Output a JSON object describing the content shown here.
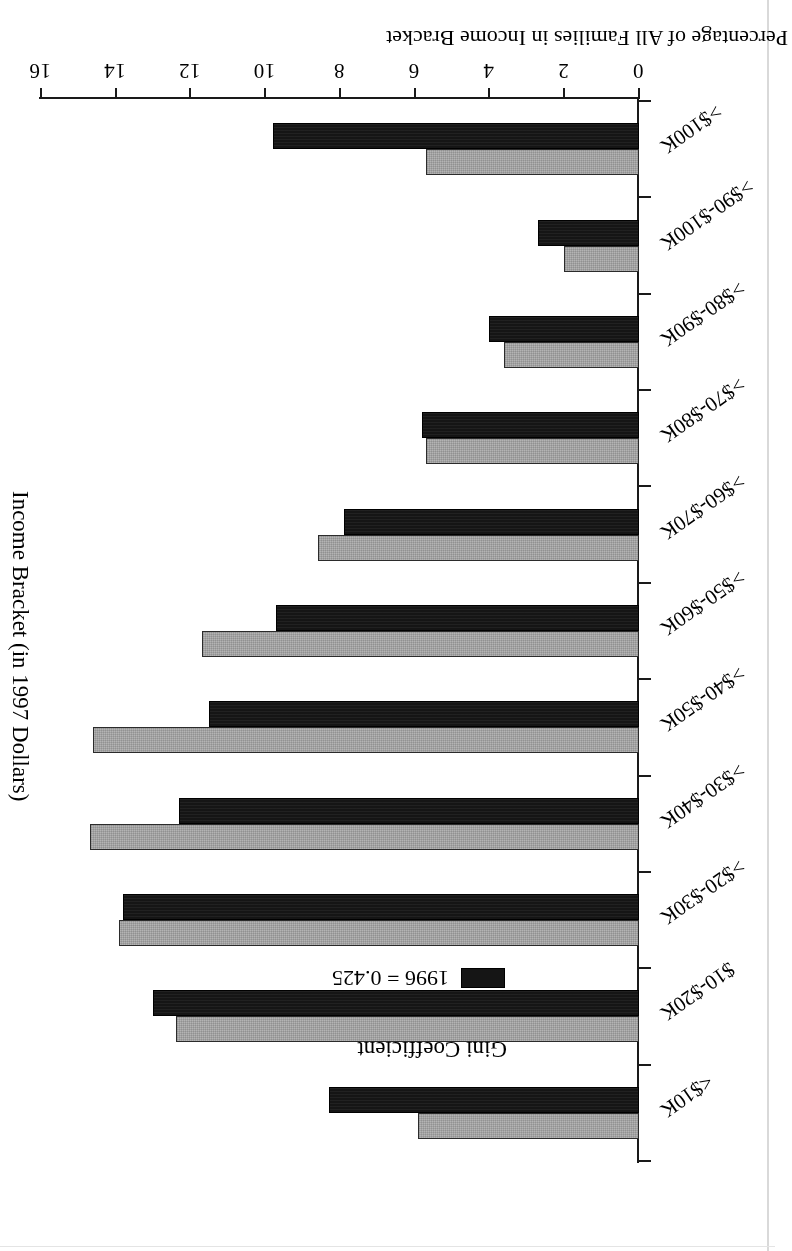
{
  "figure": {
    "rotation_note": "page scanned upside-down (180 degrees)",
    "background_color": "#ffffff",
    "ink_color": "#000000"
  },
  "legend": {
    "title": "Gini Coefficient",
    "position": "upper-center-right",
    "entries": [
      {
        "label": "1973 = 0.356",
        "swatch_color": "#b4b4b4",
        "series": "1973"
      },
      {
        "label": "1996 = 0.425",
        "swatch_color": "#151515",
        "series": "1996"
      }
    ]
  },
  "chart_data": {
    "type": "bar",
    "title": "",
    "subtitle": "",
    "orientation": "vertical-bars-rotated-180",
    "xlabel": "Income Bracket (in 1997 Dollars)",
    "ylabel": "Percentage of All Families in Income Bracket",
    "ylim": [
      0,
      16
    ],
    "yticks": [
      0,
      2,
      4,
      6,
      8,
      10,
      12,
      14,
      16
    ],
    "ytick_labels": [
      "0",
      "2",
      "4",
      "6",
      "8",
      "10",
      "12",
      "14",
      "16"
    ],
    "grid": false,
    "legend_position": "upper-right",
    "categories": [
      "<$10K",
      "$10-$20K",
      ">$20-$30K",
      ">$30-$40K",
      ">$40-$50K",
      ">$50-$60K",
      ">$60-$70K",
      ">$70-$80K",
      ">$80-$90K",
      ">$90-$100K",
      ">$100K"
    ],
    "series": [
      {
        "name": "1973 = 0.356",
        "color": "#b4b4b4",
        "values": [
          5.9,
          12.4,
          13.9,
          14.7,
          14.6,
          11.7,
          8.6,
          5.7,
          3.6,
          2.0,
          5.7
        ]
      },
      {
        "name": "1996 = 0.425",
        "color": "#151515",
        "values": [
          8.3,
          13.0,
          13.8,
          12.3,
          11.5,
          9.7,
          7.9,
          5.8,
          4.0,
          2.7,
          9.8
        ]
      }
    ],
    "annotations": [
      "Gini Coefficient 1973 = 0.356",
      "Gini Coefficient 1996 = 0.425"
    ]
  }
}
